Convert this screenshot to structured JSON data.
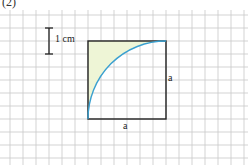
{
  "figure": {
    "part_label": "(2)",
    "scale_bar": {
      "label": "1 cm"
    },
    "square": {
      "side_bottom_label": "a",
      "side_right_label": "a"
    },
    "colors": {
      "grid": "#c8c8c8",
      "outline": "#222222",
      "arc": "#3aa0d0",
      "shaded_region": "#eef5d6",
      "background": "#ffffff"
    }
  }
}
